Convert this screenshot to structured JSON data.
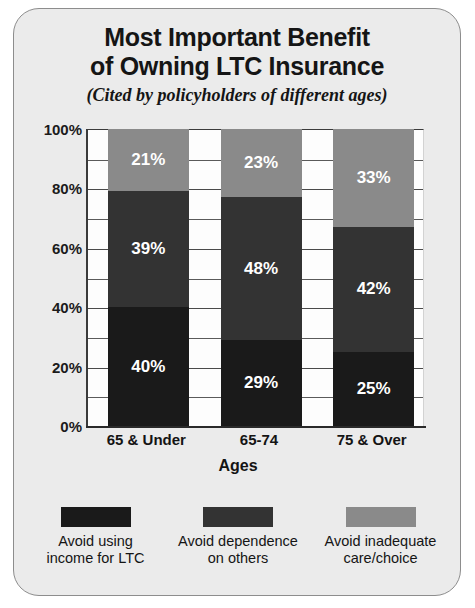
{
  "card": {
    "background": "#ebebeb",
    "border_color": "#8d8d8d"
  },
  "title": {
    "line1": "Most Important Benefit",
    "line2": "of Owning LTC Insurance",
    "subtitle": "(Cited by policyholders of different ages)"
  },
  "chart_data": {
    "type": "bar",
    "stacked": true,
    "stacked_mode": "percent",
    "title": "Most Important Benefit of Owning LTC Insurance",
    "subtitle": "(Cited by policyholders of different ages)",
    "xlabel": "Ages",
    "ylabel": "",
    "ylim": [
      0,
      100
    ],
    "yticks": [
      "0%",
      "20%",
      "40%",
      "60%",
      "80%",
      "100%"
    ],
    "ytick_values": [
      0,
      20,
      40,
      60,
      80,
      100
    ],
    "minor_gridline_step": 10,
    "grid": true,
    "legend_position": "bottom",
    "categories": [
      "65 & Under",
      "65-74",
      "75 & Over"
    ],
    "series": [
      {
        "name": "Avoid using income for LTC",
        "legend_label": "Avoid using\nincome for LTC",
        "color": "#1a1a1a",
        "values": [
          40,
          29,
          25
        ],
        "labels": [
          "40%",
          "29%",
          "25%"
        ]
      },
      {
        "name": "Avoid dependence on others",
        "legend_label": "Avoid dependence\non others",
        "color": "#333333",
        "values": [
          39,
          48,
          42
        ],
        "labels": [
          "39%",
          "48%",
          "42%"
        ]
      },
      {
        "name": "Avoid inadequate care/choice",
        "legend_label": "Avoid inadequate\ncare/choice",
        "color": "#8a8a8a",
        "values": [
          21,
          23,
          33
        ],
        "labels": [
          "21%",
          "23%",
          "33%"
        ]
      }
    ]
  }
}
